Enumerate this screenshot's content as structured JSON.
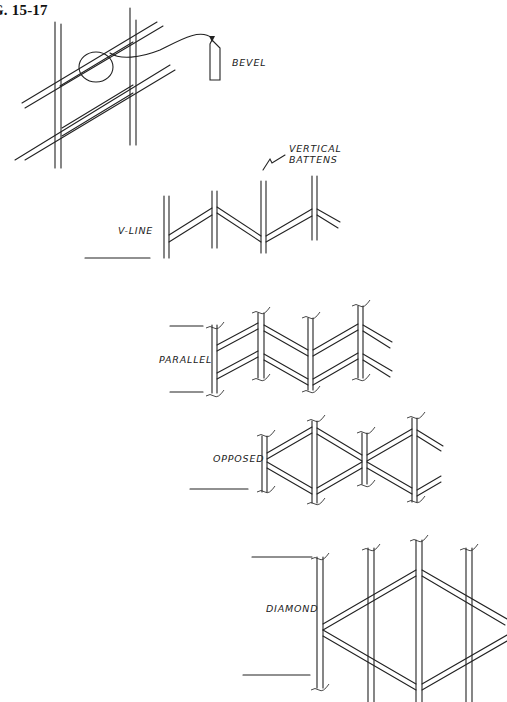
{
  "figure": {
    "title_visible": "G. 15-17"
  },
  "labels": {
    "bevel": "BEVEL",
    "vertical_battens_line1": "VERTICAL",
    "vertical_battens_line2": "BATTENS",
    "v_line": "V-LINE",
    "parallel": "PARALLEL",
    "opposed": "OPPOSED",
    "diamond": "DIAMOND"
  },
  "patterns": [
    {
      "name": "V-LINE",
      "description": "Single rail zig-zag between vertical battens"
    },
    {
      "name": "PARALLEL",
      "description": "Two parallel rails zig-zag between vertical battens"
    },
    {
      "name": "OPPOSED",
      "description": "Rails in opposed V arrangement forming X shapes"
    },
    {
      "name": "DIAMOND",
      "description": "Rails crossing to form diamond shape across battens"
    }
  ],
  "colors": {
    "ink": "#222222",
    "background": "#ffffff"
  }
}
